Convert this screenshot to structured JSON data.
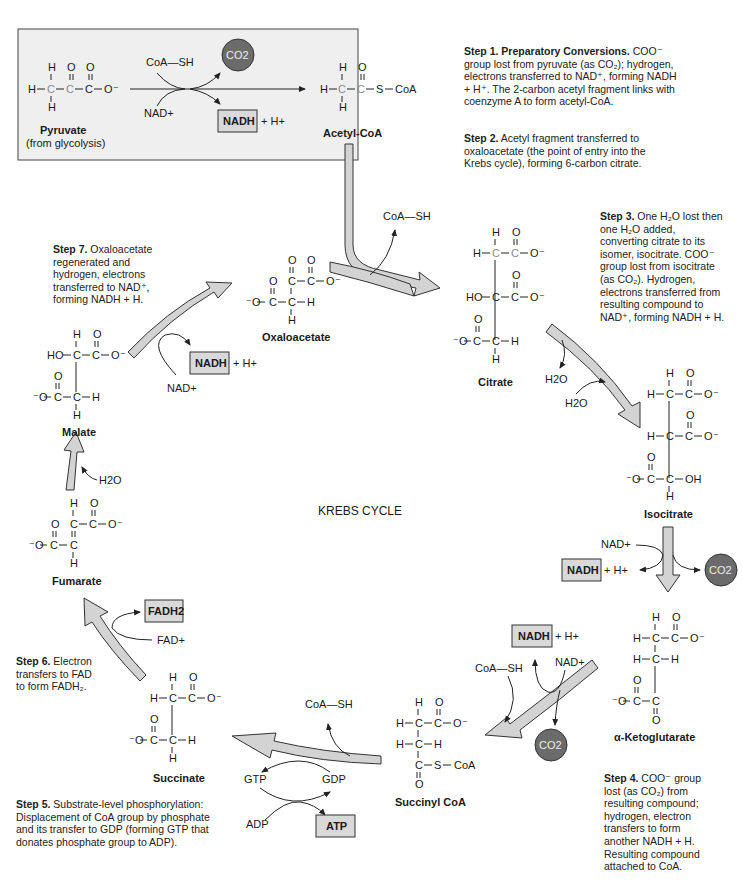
{
  "title": "KREBS CYCLE",
  "colors": {
    "prep_box_bg": "#efefef",
    "arrow_fill": "#d3d3d3",
    "product_box_fill": "#d9d9d9",
    "co2_circle_fill": "#6b6b6b"
  },
  "prep": {
    "pyruvate_name": "Pyruvate",
    "pyruvate_source": "(from glycolysis)",
    "coa_sh": "CoA—SH",
    "nad": "NAD+",
    "co2": "CO2",
    "nadh": "NADH",
    "h_plus": "+ H+",
    "acetyl_coa_name": "Acetyl-CoA"
  },
  "molecules": {
    "oxaloacetate": "Oxaloacetate",
    "citrate": "Citrate",
    "isocitrate": "Isocitrate",
    "alpha_ketoglutarate": "α-Ketoglutarate",
    "succinyl_coa": "Succinyl CoA",
    "succinate": "Succinate",
    "fumarate": "Fumarate",
    "malate": "Malate"
  },
  "cofactors": {
    "coa_sh": "CoA—SH",
    "h2o": "H2O",
    "nad": "NAD+",
    "nadh": "NADH",
    "h_plus": "+ H+",
    "co2": "CO2",
    "gtp": "GTP",
    "gdp": "GDP",
    "adp": "ADP",
    "atp": "ATP",
    "fad": "FAD+",
    "fadh2": "FADH2"
  },
  "steps": [
    {
      "label": "Step 1.",
      "title": "Preparatory Conversions.",
      "text": "COO⁻ group lost from pyruvate (as CO₂); hydrogen, electrons transferred to NAD⁺, forming NADH + H⁺. The 2-carbon acetyl fragment links with coenzyme A to form acetyl-CoA."
    },
    {
      "label": "Step 2.",
      "title": "",
      "text": "Acetyl fragment transferred to oxaloacetate (the point of entry into the Krebs cycle), forming 6-carbon citrate."
    },
    {
      "label": "Step 3.",
      "title": "",
      "text": "One H₂O lost then one H₂O added, converting citrate to its isomer, isocitrate. COO⁻ group lost from isocitrate (as CO₂). Hydrogen, electrons transferred from resulting compound to NAD⁺, forming NADH + H."
    },
    {
      "label": "Step 4.",
      "title": "",
      "text": "COO⁻ group lost (as CO₂) from resulting compound; hydrogen, electron transfers to form another NADH + H. Resulting compound attached to CoA."
    },
    {
      "label": "Step 5.",
      "title": "",
      "text": "Substrate-level phosphorylation: Displacement of CoA group by phosphate and its transfer to GDP (forming GTP that donates phosphate group to ADP)."
    },
    {
      "label": "Step 6.",
      "title": "",
      "text": "Electron transfers to FAD to form FADH₂."
    },
    {
      "label": "Step 7.",
      "title": "",
      "text": "Oxaloacetate regenerated and hydrogen, electrons transferred to NAD⁺, forming NADH + H."
    }
  ]
}
